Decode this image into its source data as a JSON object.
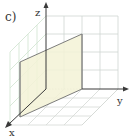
{
  "figure": {
    "panel_label": "c)",
    "axes": {
      "x_label": "x",
      "y_label": "y",
      "z_label": "z"
    },
    "colors": {
      "axis": "#3a3a3a",
      "grid_back": "#cfd6d2",
      "grid_side": "#cfe3cf",
      "grid_floor": "#d6d9d6",
      "plane_fill": "#f3f2d6",
      "plane_edge": "#6e6e6e"
    }
  }
}
